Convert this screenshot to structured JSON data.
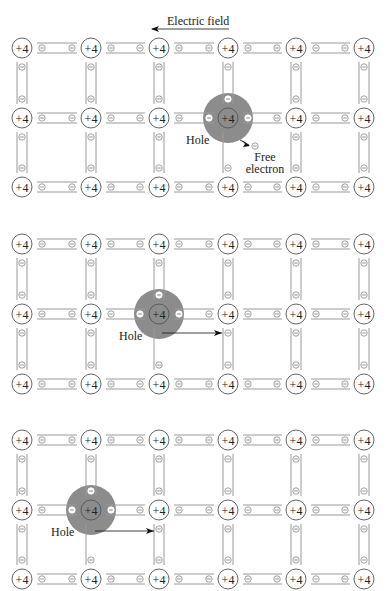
{
  "figure": {
    "field_label": "Electric field",
    "atom_label": "+4",
    "electron_symbol": "−",
    "hole_label": "Hole",
    "free_electron_label_line1": "Free",
    "free_electron_label_line2": "electron",
    "colors": {
      "line": "#9a9a9a",
      "atom_stroke": "#555555",
      "hole_fill": "#8c8c8c",
      "text": "#222222",
      "background": "#ffffff"
    }
  },
  "grid": {
    "columns_x": [
      22,
      91,
      159,
      228,
      296,
      364
    ],
    "panels": [
      {
        "name": "panel-1",
        "rows_y": [
          48,
          118,
          187
        ],
        "hole": {
          "col": 3,
          "row": 1,
          "missing": "down"
        },
        "free_electron": {
          "x": 255,
          "y": 146
        },
        "show_field": true
      },
      {
        "name": "panel-2",
        "rows_y": [
          244,
          314,
          384
        ],
        "hole": {
          "col": 2,
          "row": 1,
          "missing": "down"
        },
        "arrow": {
          "x1": 162,
          "y1": 333,
          "x2": 222,
          "y2": 333
        }
      },
      {
        "name": "panel-3",
        "rows_y": [
          440,
          510,
          579
        ],
        "hole": {
          "col": 1,
          "row": 1,
          "missing": "down"
        },
        "arrow": {
          "x1": 95,
          "y1": 531,
          "x2": 154,
          "y2": 531
        }
      }
    ]
  }
}
